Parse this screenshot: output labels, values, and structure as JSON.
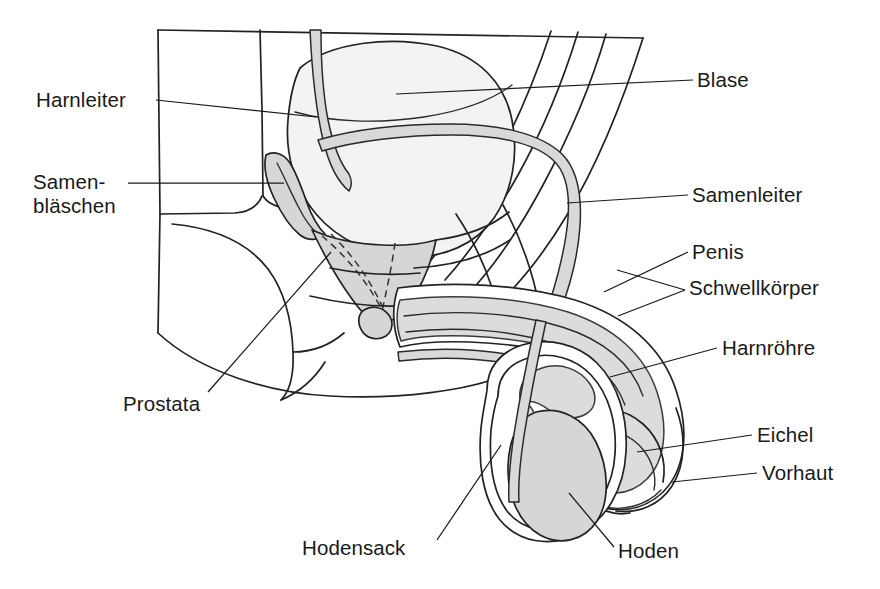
{
  "figure": {
    "type": "anatomical-line-diagram",
    "language": "de",
    "colors": {
      "ink": "#1f1f1f",
      "organ_fill": "#d6d6d6",
      "bladder_fill": "#f2f2f2",
      "background": "#ffffff"
    }
  },
  "labels": {
    "harnleiter": "Harnleiter",
    "samenblaeschen_line1": "Samen-",
    "samenblaeschen_line2": "bläschen",
    "prostata": "Prostata",
    "hodensack": "Hodensack",
    "blase": "Blase",
    "samenleiter": "Samenleiter",
    "penis": "Penis",
    "schwellkoerper": "Schwellkörper",
    "harnroehre": "Harnröhre",
    "eichel": "Eichel",
    "vorhaut": "Vorhaut",
    "hoden": "Hoden"
  },
  "label_list": [
    {
      "key": "harnleiter",
      "text": "Harnleiter",
      "side": "left"
    },
    {
      "key": "samenblaeschen",
      "text": "Samenbläschen",
      "side": "left"
    },
    {
      "key": "prostata",
      "text": "Prostata",
      "side": "left"
    },
    {
      "key": "hodensack",
      "text": "Hodensack",
      "side": "left"
    },
    {
      "key": "blase",
      "text": "Blase",
      "side": "right"
    },
    {
      "key": "samenleiter",
      "text": "Samenleiter",
      "side": "right"
    },
    {
      "key": "penis",
      "text": "Penis",
      "side": "right"
    },
    {
      "key": "schwellkoerper",
      "text": "Schwellkörper",
      "side": "right"
    },
    {
      "key": "harnroehre",
      "text": "Harnröhre",
      "side": "right"
    },
    {
      "key": "eichel",
      "text": "Eichel",
      "side": "right"
    },
    {
      "key": "vorhaut",
      "text": "Vorhaut",
      "side": "right"
    },
    {
      "key": "hoden",
      "text": "Hoden",
      "side": "bottom"
    }
  ]
}
